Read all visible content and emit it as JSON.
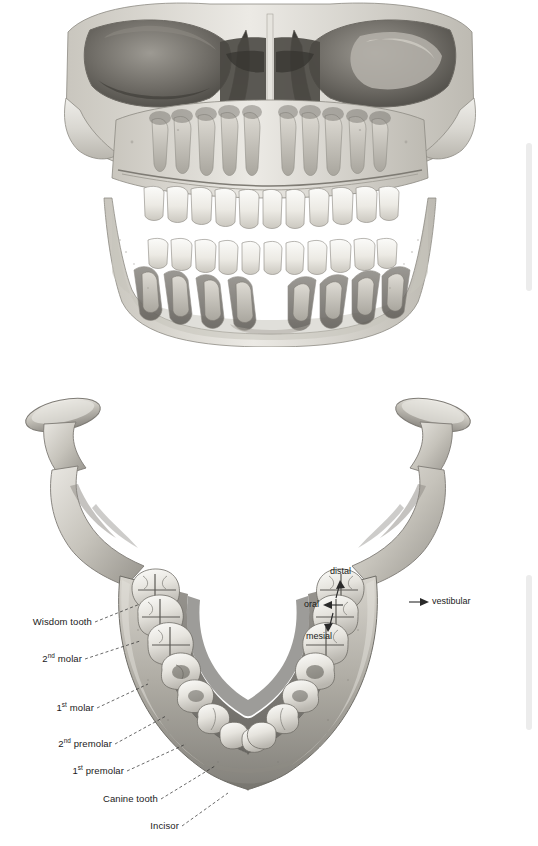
{
  "document": {
    "background_color": "#ffffff",
    "ink_color": "#1a1a1a"
  },
  "figures": {
    "skull": {
      "name": "skull-frontal-view-with-developing-teeth",
      "caption": ""
    },
    "mandible": {
      "name": "mandible-occlusal-view",
      "caption": ""
    }
  },
  "tooth_labels": [
    {
      "id": "wisdom-tooth",
      "text": "Wisdom tooth",
      "ordinal": "",
      "suffix": ""
    },
    {
      "id": "second-molar",
      "text": " molar",
      "ordinal": "2",
      "suffix": "nd"
    },
    {
      "id": "first-molar",
      "text": " molar",
      "ordinal": "1",
      "suffix": "st"
    },
    {
      "id": "second-premolar",
      "text": " premolar",
      "ordinal": "2",
      "suffix": "nd"
    },
    {
      "id": "first-premolar",
      "text": " premolar",
      "ordinal": "1",
      "suffix": "st"
    },
    {
      "id": "canine-tooth",
      "text": "Canine tooth",
      "ordinal": "",
      "suffix": ""
    },
    {
      "id": "incisor",
      "text": "Incisor",
      "ordinal": "",
      "suffix": ""
    }
  ],
  "direction_labels": [
    {
      "id": "distal",
      "text": "distal",
      "arrow": "up"
    },
    {
      "id": "oral",
      "text": "oral",
      "arrow": "left"
    },
    {
      "id": "mesial",
      "text": "mesial",
      "arrow": "down"
    },
    {
      "id": "vestibular",
      "text": "vestibular",
      "arrow": "right"
    }
  ],
  "scrollbars": [
    {
      "id": "scroll-strip-top",
      "color": "#ececec"
    },
    {
      "id": "scroll-strip-bottom",
      "color": "#ececec"
    }
  ]
}
